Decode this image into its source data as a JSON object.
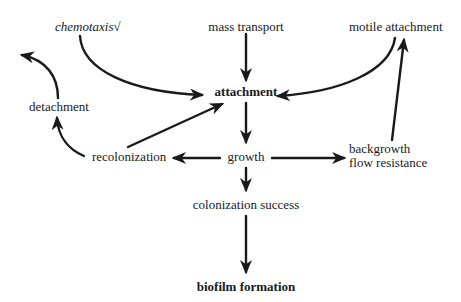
{
  "diagram": {
    "type": "flow-diagram",
    "nodes": {
      "chemotaxis": "chemotaxis√",
      "mass_transport": "mass transport",
      "motile_attachment": "motile attachment",
      "attachment": "attachment",
      "detachment": "detachment",
      "recolonization": "recolonization",
      "growth": "growth",
      "backgrowth": "backgrowth",
      "flow_resistance": "flow resistance",
      "colonization_success": "colonization success",
      "biofilm_formation": "biofilm formation"
    },
    "edges": [
      {
        "from": "chemotaxis",
        "to": "attachment"
      },
      {
        "from": "mass_transport",
        "to": "attachment"
      },
      {
        "from": "motile_attachment",
        "to": "attachment"
      },
      {
        "from": "attachment",
        "to": "growth"
      },
      {
        "from": "growth",
        "to": "recolonization"
      },
      {
        "from": "growth",
        "to": "backgrowth_flow_resistance"
      },
      {
        "from": "backgrowth_flow_resistance",
        "to": "motile_attachment"
      },
      {
        "from": "recolonization",
        "to": "attachment"
      },
      {
        "from": "recolonization",
        "to": "detachment"
      },
      {
        "from": "detachment",
        "to": "out-left"
      },
      {
        "from": "growth",
        "to": "colonization_success"
      },
      {
        "from": "colonization_success",
        "to": "biofilm_formation"
      }
    ],
    "colors": {
      "ink": "#1a1a1a",
      "background": "#ffffff"
    }
  }
}
